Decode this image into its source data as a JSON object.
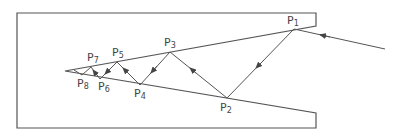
{
  "diagram": {
    "type": "wedge-ray-reflection",
    "stroke_color": "#555555",
    "background": "#ffffff",
    "points": [
      {
        "id": "P1",
        "label": "P",
        "sub": "1"
      },
      {
        "id": "P2",
        "label": "P",
        "sub": "2"
      },
      {
        "id": "P3",
        "label": "P",
        "sub": "3"
      },
      {
        "id": "P4",
        "label": "P",
        "sub": "4"
      },
      {
        "id": "P5",
        "label": "P",
        "sub": "5"
      },
      {
        "id": "P6",
        "label": "P",
        "sub": "6"
      },
      {
        "id": "P7",
        "label": "P",
        "sub": "7"
      },
      {
        "id": "P8",
        "label": "P",
        "sub": "8"
      }
    ]
  }
}
